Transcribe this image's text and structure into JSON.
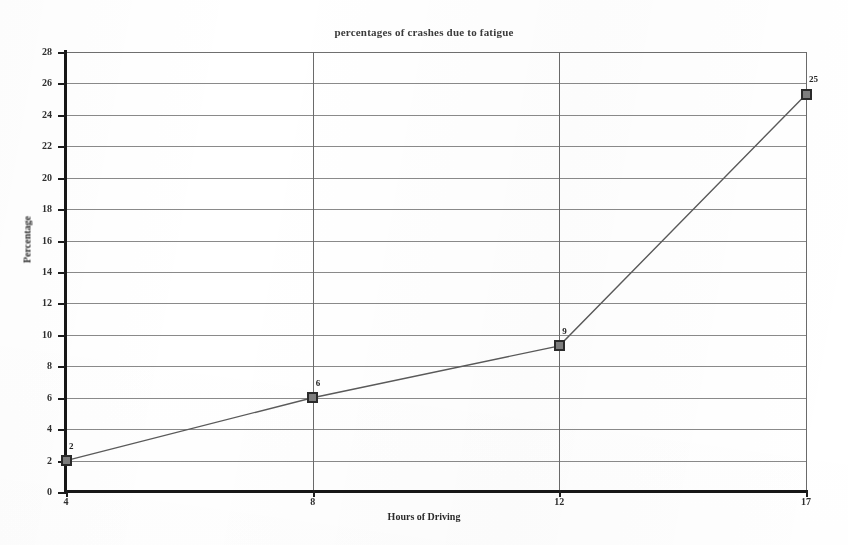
{
  "chart_data": {
    "type": "line",
    "title": "percentages of crashes due to fatigue",
    "xlabel": "Hours of Driving",
    "ylabel": "Percentage",
    "categories": [
      "4",
      "8",
      "12",
      "17"
    ],
    "x": [
      4,
      8,
      12,
      17
    ],
    "values": [
      2,
      6,
      9.3,
      25.3
    ],
    "point_labels": [
      "2",
      "6",
      "9",
      "25"
    ],
    "ylim": [
      0,
      28
    ],
    "y_ticks": [
      "0",
      "2",
      "4",
      "6",
      "8",
      "10",
      "12",
      "14",
      "16",
      "18",
      "20",
      "22",
      "24",
      "26",
      "28"
    ],
    "x_ticks": [
      "4",
      "8",
      "12",
      "17"
    ],
    "grid": "horizontal and vertical",
    "legend": "none",
    "series": [
      {
        "name": "percentage of crashes",
        "values": [
          2,
          6,
          9.3,
          25.3
        ]
      }
    ],
    "colors": {
      "line": "#5a5a5a",
      "marker_fill": "#7e7e7e",
      "marker_edge": "#2a2a2a",
      "grid": "#8a8a8a",
      "axis": "#171717",
      "text": "#2e2e2e",
      "background": "#ffffff"
    }
  }
}
